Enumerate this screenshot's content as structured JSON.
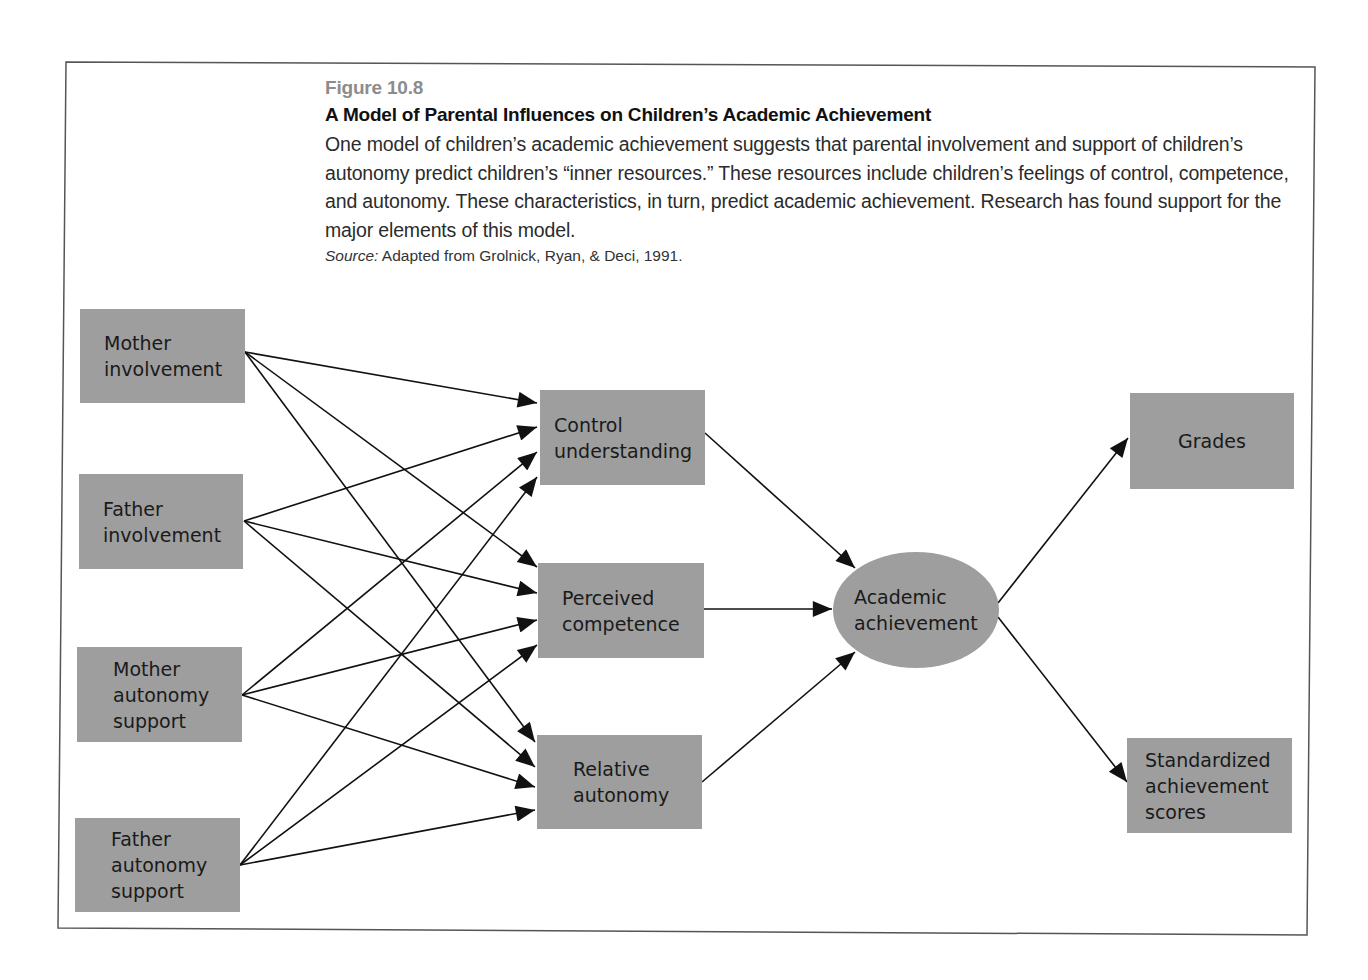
{
  "caption": {
    "figure_number": "Figure 10.8",
    "title": "A Model of Parental Influences on Children’s Academic Achievement",
    "description": "One model of children’s academic achievement suggests that parental involvement and support of children’s autonomy predict children’s “inner resources.” These resources include children’s feelings of control, competence, and autonomy. These characteristics, in turn, predict academic achievement. Research has found support for the major elements of this model.",
    "source_label": "Source:",
    "source_text": " Adapted from Grolnick, Ryan, & Deci, 1991."
  },
  "colors": {
    "node_fill": "#9e9e9e",
    "edge": "#111111",
    "frame": "#555555"
  },
  "diagram": {
    "nodes": [
      {
        "id": "mother-involvement",
        "shape": "box",
        "column": "parental",
        "lines": [
          "Mother",
          "involvement"
        ]
      },
      {
        "id": "father-involvement",
        "shape": "box",
        "column": "parental",
        "lines": [
          "Father",
          "involvement"
        ]
      },
      {
        "id": "mother-autonomy-support",
        "shape": "box",
        "column": "parental",
        "lines": [
          "Mother",
          "autonomy",
          "support"
        ]
      },
      {
        "id": "father-autonomy-support",
        "shape": "box",
        "column": "parental",
        "lines": [
          "Father",
          "autonomy",
          "support"
        ]
      },
      {
        "id": "control-understanding",
        "shape": "box",
        "column": "inner-resources",
        "lines": [
          "Control",
          "understanding"
        ]
      },
      {
        "id": "perceived-competence",
        "shape": "box",
        "column": "inner-resources",
        "lines": [
          "Perceived",
          "competence"
        ]
      },
      {
        "id": "relative-autonomy",
        "shape": "box",
        "column": "inner-resources",
        "lines": [
          "Relative",
          "autonomy"
        ]
      },
      {
        "id": "academic-achievement",
        "shape": "ellipse",
        "column": "outcome",
        "lines": [
          "Academic",
          "achievement"
        ]
      },
      {
        "id": "grades",
        "shape": "box",
        "column": "measures",
        "lines": [
          "Grades"
        ]
      },
      {
        "id": "standardized-achievement-scores",
        "shape": "box",
        "column": "measures",
        "lines": [
          "Standardized",
          "achievement",
          "scores"
        ]
      }
    ],
    "edges": [
      {
        "from": "mother-involvement",
        "to": "control-understanding"
      },
      {
        "from": "mother-involvement",
        "to": "perceived-competence"
      },
      {
        "from": "mother-involvement",
        "to": "relative-autonomy"
      },
      {
        "from": "father-involvement",
        "to": "control-understanding"
      },
      {
        "from": "father-involvement",
        "to": "perceived-competence"
      },
      {
        "from": "father-involvement",
        "to": "relative-autonomy"
      },
      {
        "from": "mother-autonomy-support",
        "to": "control-understanding"
      },
      {
        "from": "mother-autonomy-support",
        "to": "perceived-competence"
      },
      {
        "from": "mother-autonomy-support",
        "to": "relative-autonomy"
      },
      {
        "from": "father-autonomy-support",
        "to": "control-understanding"
      },
      {
        "from": "father-autonomy-support",
        "to": "perceived-competence"
      },
      {
        "from": "father-autonomy-support",
        "to": "relative-autonomy"
      },
      {
        "from": "control-understanding",
        "to": "academic-achievement"
      },
      {
        "from": "perceived-competence",
        "to": "academic-achievement"
      },
      {
        "from": "relative-autonomy",
        "to": "academic-achievement"
      },
      {
        "from": "academic-achievement",
        "to": "grades"
      },
      {
        "from": "academic-achievement",
        "to": "standardized-achievement-scores"
      }
    ]
  }
}
